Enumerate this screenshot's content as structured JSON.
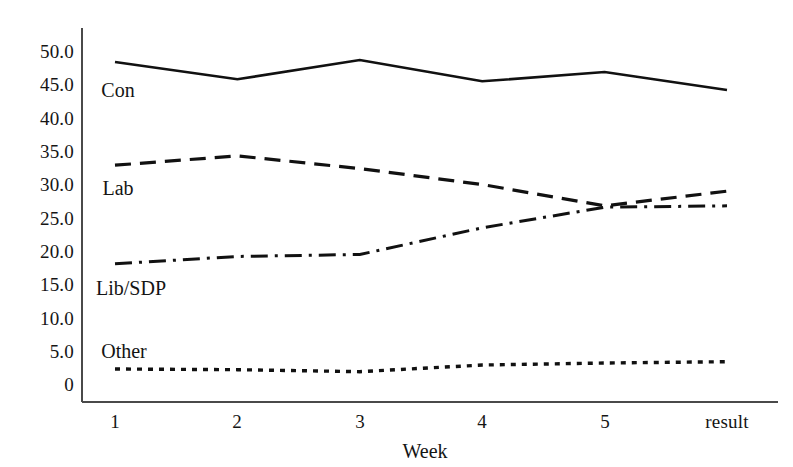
{
  "chart_data": {
    "type": "line",
    "title": "",
    "subtitle": "",
    "xlabel": "Week",
    "ylabel": "",
    "categories": [
      "1",
      "2",
      "3",
      "4",
      "5",
      "result"
    ],
    "x_tick_labels": [
      "1",
      "2",
      "3",
      "4",
      "5",
      "result"
    ],
    "y_tick_labels": [
      "50.0",
      "45.0",
      "40.0",
      "35.0",
      "30.0",
      "25.0",
      "20.0",
      "15.0",
      "10.0",
      "5.0",
      "0"
    ],
    "y_tick_values": [
      50,
      45,
      40,
      35,
      30,
      25,
      20,
      15,
      10,
      5,
      0
    ],
    "ylim": [
      0,
      52
    ],
    "xlim": [
      0,
      5
    ],
    "grid": false,
    "legend_position": "inline-left",
    "series": [
      {
        "name": "Con",
        "style": "solid",
        "color": "#111111",
        "values": [
          48.2,
          45.6,
          48.5,
          45.3,
          46.7,
          44.0
        ],
        "label_x": 118,
        "label_y": 90
      },
      {
        "name": "Lab",
        "style": "dashed",
        "color": "#111111",
        "values": [
          32.7,
          34.1,
          32.2,
          29.8,
          26.6,
          28.8
        ],
        "label_x": 118,
        "label_y": 188
      },
      {
        "name": "Lib/SDP",
        "style": "dashdot",
        "color": "#111111",
        "values": [
          17.9,
          19.0,
          19.3,
          23.3,
          26.4,
          26.6
        ],
        "label_x": 131,
        "label_y": 288
      },
      {
        "name": "Other",
        "style": "dotted",
        "color": "#111111",
        "values": [
          2.1,
          2.0,
          1.7,
          2.7,
          3.0,
          3.2
        ],
        "label_x": 124,
        "label_y": 351
      }
    ],
    "annotations": []
  },
  "axes": {
    "axis_color": "#4a4a4a",
    "x_axis_title": "Week"
  }
}
